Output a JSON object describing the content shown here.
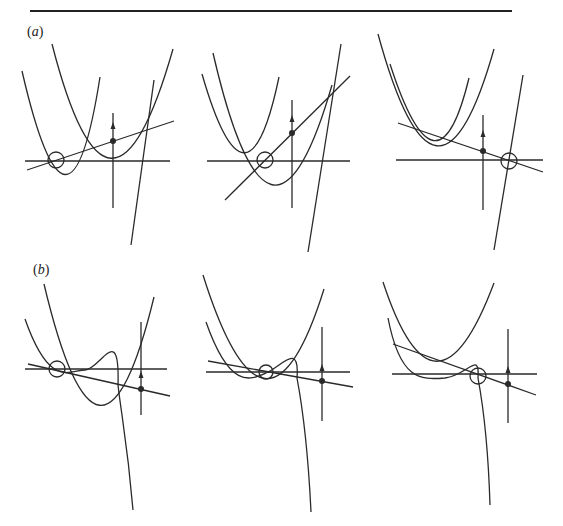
{
  "figure": {
    "top_rule": {
      "x1": 30,
      "x2": 512,
      "y": 11
    },
    "stroke_color": "#2a2a2a",
    "rows": [
      {
        "label": "(a)",
        "label_letter": "a",
        "label_pos": {
          "x": 27,
          "y": 24
        },
        "description": "Three panels, each showing two parabolas, a secant line through two of their intersections, a horizontal axis, a vertical axis with upward arrow and a filled dot on the line, and an open circle marking a root on the axis; a steep line crosses near the right.",
        "panels": [
          {
            "name": "a1",
            "axis_h": {
              "x1": 25,
              "x2": 170,
              "y": 161
            },
            "axis_v": {
              "x": 113,
              "y1": 113,
              "y2": 208
            },
            "arrow": {
              "x": 113,
              "y": 125
            },
            "dot": {
              "x": 113,
              "y": 141
            },
            "open_circle": {
              "x": 56,
              "y": 160,
              "r": 8
            },
            "line": {
              "x1": 27,
              "y1": 170,
              "x2": 174,
              "y2": 121
            },
            "steep_line": {
              "x1": 131,
              "y1": 245,
              "x2": 154,
              "y2": 80
            },
            "curves": [
              "M22,71 Q 69,275 100,77",
              "M52,44 Q 110,270 173,49"
            ]
          },
          {
            "name": "a2",
            "axis_h": {
              "x1": 207,
              "x2": 350,
              "y": 161
            },
            "axis_v": {
              "x": 292,
              "y1": 100,
              "y2": 208
            },
            "arrow": {
              "x": 292,
              "y": 118
            },
            "dot": {
              "x": 292,
              "y": 133
            },
            "open_circle": {
              "x": 265,
              "y": 160,
              "r": 8
            },
            "line": {
              "x1": 225,
              "y1": 200,
              "x2": 350,
              "y2": 76
            },
            "steep_line": {
              "x1": 308,
              "y1": 252,
              "x2": 341,
              "y2": 44
            },
            "curves": [
              "M202,74 Q 247,230 279,77",
              "M213,53 Q 270,300 332,85"
            ]
          },
          {
            "name": "a3",
            "axis_h": {
              "x1": 396,
              "x2": 543,
              "y": 160
            },
            "axis_v": {
              "x": 483,
              "y1": 115,
              "y2": 210
            },
            "arrow": {
              "x": 483,
              "y": 133
            },
            "dot": {
              "x": 483,
              "y": 151
            },
            "open_circle": {
              "x": 509,
              "y": 161,
              "r": 8
            },
            "line": {
              "x1": 398,
              "y1": 123,
              "x2": 543,
              "y2": 172
            },
            "steep_line": {
              "x1": 494,
              "y1": 250,
              "x2": 523,
              "y2": 75
            },
            "curves": [
              "M378,34 Q 437,250 494,49",
              "M390,64 Q 437,210 469,78"
            ]
          }
        ]
      },
      {
        "label": "(b)",
        "label_letter": "b",
        "label_pos": {
          "x": 33,
          "y": 262
        },
        "description": "Three panels, each showing a parabola, a cubic-like curve with a vertical asymptotic tail, a secant line, a horizontal axis, a vertical axis with upward arrow and filled dot, and an open circle marking a root.",
        "panels": [
          {
            "name": "b1",
            "axis_h": {
              "x1": 25,
              "x2": 167,
              "y": 369
            },
            "axis_v": {
              "x": 141,
              "y1": 322,
              "y2": 415
            },
            "arrow": {
              "x": 141,
              "y": 374
            },
            "dot": {
              "x": 141,
              "y": 389
            },
            "open_circle": {
              "x": 57,
              "y": 369,
              "r": 8
            },
            "line": {
              "x1": 28,
              "y1": 364,
              "x2": 170,
              "y2": 396
            },
            "curves": [
              "M44,284 Q 100,520 154,297",
              "M25,319 C 50,390 70,370 85,370 C 100,370 120,320 118,385 C 122,420 127,440 133,510"
            ]
          },
          {
            "name": "b2",
            "axis_h": {
              "x1": 206,
              "x2": 350,
              "y": 372
            },
            "axis_v": {
              "x": 322,
              "y1": 327,
              "y2": 421
            },
            "arrow": {
              "x": 322,
              "y": 367
            },
            "dot": {
              "x": 322,
              "y": 381
            },
            "open_circle": {
              "x": 266,
              "y": 372,
              "r": 7
            },
            "line": {
              "x1": 208,
              "y1": 361,
              "x2": 353,
              "y2": 387
            },
            "curves": [
              "M203,275 Q 266,475 324,289",
              "M206,322 C 230,390 250,380 266,373 C 280,368 300,340 297,378 C 303,410 308,450 311,512"
            ]
          },
          {
            "name": "b3",
            "axis_h": {
              "x1": 392,
              "x2": 537,
              "y": 374
            },
            "axis_v": {
              "x": 508,
              "y1": 329,
              "y2": 423
            },
            "arrow": {
              "x": 508,
              "y": 369
            },
            "dot": {
              "x": 508,
              "y": 384
            },
            "open_circle": {
              "x": 478,
              "y": 376,
              "r": 8
            },
            "line": {
              "x1": 393,
              "y1": 344,
              "x2": 536,
              "y2": 395
            },
            "curves": [
              "M383,282 Q 435,440 494,283",
              "M388,318 C 400,380 420,380 445,378 C 468,375 480,350 478,378 C 483,405 488,440 490,505"
            ]
          }
        ]
      }
    ]
  }
}
